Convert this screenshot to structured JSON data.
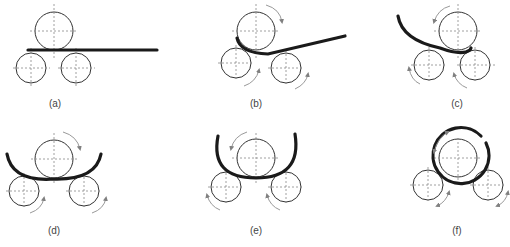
{
  "figure": {
    "panels": [
      {
        "id": "a",
        "label": "(a)",
        "stage": "flat plate inserted"
      },
      {
        "id": "b",
        "label": "(b)",
        "stage": "top roller pressing, rollers rotate clockwise"
      },
      {
        "id": "c",
        "label": "(c)",
        "stage": "plate rolled, rollers reverse (counter-clockwise)"
      },
      {
        "id": "d",
        "label": "(d)",
        "stage": "symmetric bend, rollers rotate clockwise"
      },
      {
        "id": "e",
        "label": "(e)",
        "stage": "deeper bend, rollers rotate counter-clockwise"
      },
      {
        "id": "f",
        "label": "(f)",
        "stage": "plate closed into cylinder around top roller"
      }
    ]
  },
  "colors": {
    "background": "#ffffff",
    "roller": "#333333",
    "plate": "#1a1a1a",
    "arrow": "#808080",
    "centerline": "#888888"
  }
}
